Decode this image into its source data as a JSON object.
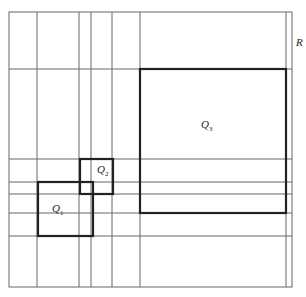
{
  "diagram": {
    "outer_region": {
      "label": "R",
      "x": 9,
      "y": 12,
      "w": 283,
      "h": 275
    },
    "vertical_lines": [
      37,
      79,
      91,
      112,
      140,
      286
    ],
    "horizontal_lines": [
      69,
      159,
      182,
      194,
      213,
      236
    ],
    "squares": [
      {
        "id": "Q1",
        "label": "Q",
        "sub": "1",
        "x": 38,
        "y": 182,
        "w": 55,
        "h": 54
      },
      {
        "id": "Q2",
        "label": "Q",
        "sub": "2",
        "x": 80,
        "y": 159,
        "w": 33,
        "h": 35
      },
      {
        "id": "Q3",
        "label": "Q",
        "sub": "3",
        "x": 140,
        "y": 69,
        "w": 146,
        "h": 144
      }
    ],
    "colors": {
      "line": "#555555",
      "thick": "#222222"
    }
  }
}
